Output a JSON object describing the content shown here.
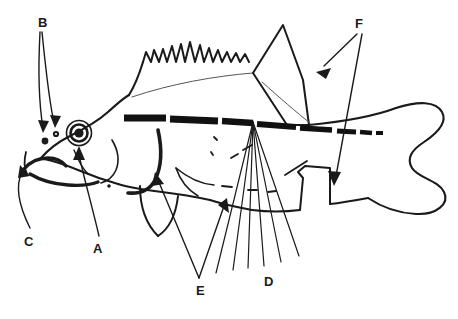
{
  "document": {
    "kind": "fish-anatomy-line-diagram",
    "subject": "lateral view of a spiny-rayed fish (perch-like)",
    "faint_header_text": "",
    "background_color": "#ffffff",
    "ink_color": "#1a1a1a"
  },
  "labels": [
    {
      "id": "B",
      "text": "B",
      "x": 38,
      "y": 16,
      "points_to": "nostrils (paired dark dots on snout)"
    },
    {
      "id": "F",
      "text": "F",
      "x": 355,
      "y": 17,
      "points_to": "dorsal fin and anal fin"
    },
    {
      "id": "C",
      "text": "C",
      "x": 24,
      "y": 235,
      "points_to": "mouth / jaw"
    },
    {
      "id": "A",
      "text": "A",
      "x": 93,
      "y": 242,
      "points_to": "eye"
    },
    {
      "id": "E",
      "text": "E",
      "x": 196,
      "y": 284,
      "points_to": "operculum and pelvic fin"
    },
    {
      "id": "D",
      "text": "D",
      "x": 264,
      "y": 275,
      "points_to": "lateral line (fanned leader lines)"
    }
  ],
  "features": [
    {
      "name": "body-outline",
      "label": null,
      "description": "closed fusiform body profile"
    },
    {
      "name": "spiny-dorsal-fin",
      "label": "F",
      "description": "serrated / wavy spined first dorsal"
    },
    {
      "name": "soft-dorsal-fin",
      "label": "F",
      "description": "tall triangular second dorsal"
    },
    {
      "name": "caudal-fin",
      "label": null,
      "description": "rounded forked tail"
    },
    {
      "name": "anal-fin",
      "label": "F",
      "description": "ventral fin behind vent"
    },
    {
      "name": "pelvic-fin",
      "label": "E",
      "description": "paired ventral fin under throat"
    },
    {
      "name": "pectoral-fin",
      "label": null,
      "description": "fin on side behind gill cover"
    },
    {
      "name": "operculum",
      "label": "E",
      "description": "thick curved gill cover"
    },
    {
      "name": "lateral-line",
      "label": "D",
      "description": "thick broken black stripe along flank"
    },
    {
      "name": "eye",
      "label": "A",
      "description": "concentric ring with dark pupil"
    },
    {
      "name": "nostrils",
      "label": "B",
      "description": "two small filled dots"
    },
    {
      "name": "mouth",
      "label": "C",
      "description": "heavy jaw line at snout"
    }
  ],
  "counts": {
    "lateral_line_leader_lines": 6,
    "label_letters": 6
  },
  "colors": {
    "ink": "#1a1a1a",
    "paper": "#ffffff",
    "thick_stripe": "#111111"
  }
}
